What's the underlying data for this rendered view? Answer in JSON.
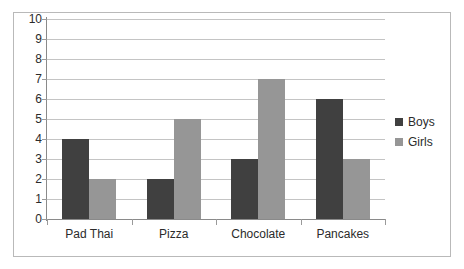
{
  "chart_data": {
    "type": "bar",
    "title": "",
    "subtitle": "",
    "xlabel": "",
    "ylabel": "",
    "categories": [
      "Pad Thai",
      "Pizza",
      "Chocolate",
      "Pancakes"
    ],
    "series": [
      {
        "name": "Boys",
        "color": "#404040",
        "values": [
          4,
          2,
          3,
          6
        ]
      },
      {
        "name": "Girls",
        "color": "#969696",
        "values": [
          2,
          5,
          7,
          3
        ]
      }
    ],
    "ylim": [
      0,
      10
    ],
    "y_ticks": [
      0,
      1,
      2,
      3,
      4,
      5,
      6,
      7,
      8,
      9,
      10
    ],
    "y_tick_labels": [
      "0",
      "1",
      "2",
      "3",
      "4",
      "5",
      "6",
      "7",
      "8",
      "9",
      "10"
    ],
    "grid": "horizontal",
    "legend_position": "right",
    "legend_entries": [
      "Boys",
      "Girls"
    ]
  },
  "legend": {
    "boys_label": "Boys",
    "girls_label": "Girls"
  },
  "colors": {
    "boys": "#404040",
    "girls": "#969696",
    "gridline": "#c4c4c4",
    "axis": "#8a8a8a",
    "frame": "#b9b9b9",
    "text": "#2b2b2b",
    "background": "#ffffff"
  }
}
